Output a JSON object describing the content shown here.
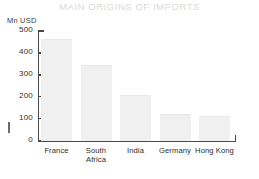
{
  "chart_data": {
    "type": "bar",
    "title": "MAIN ORIGINS OF IMPORTS",
    "xlabel": "",
    "ylabel": "Mn USD",
    "categories": [
      "France",
      "South Africa",
      "India",
      "Germany",
      "Hong Kong"
    ],
    "category_lines": [
      [
        "France"
      ],
      [
        "South",
        "Africa"
      ],
      [
        "India"
      ],
      [
        "Germany"
      ],
      [
        "Hong Kong"
      ]
    ],
    "values": [
      460,
      340,
      205,
      115,
      108
    ],
    "ylim": [
      0,
      500
    ],
    "yticks": [
      0,
      100,
      200,
      300,
      400,
      500
    ],
    "ytick_labels": [
      "0",
      "100",
      "200",
      "300",
      "400",
      "500"
    ],
    "grid": false,
    "legend": false,
    "bar_color": "#f0f0f0",
    "axis_color": "#4a4a4a",
    "title_color": "#d9dcd6"
  }
}
